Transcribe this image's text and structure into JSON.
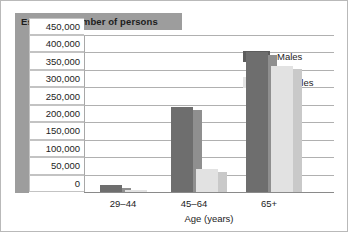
{
  "chart_data": {
    "type": "bar",
    "title": "Estimated number of persons",
    "xlabel": "Age (years)",
    "ylabel": "",
    "categories": [
      "29–44",
      "45–64",
      "65+"
    ],
    "series": [
      {
        "name": "Males",
        "values": [
          20000,
          245000,
          400000
        ],
        "color": "#6e6e6e"
      },
      {
        "name": "Females",
        "values": [
          5000,
          67000,
          360000
        ],
        "color": "#e2e2e2"
      }
    ],
    "ylim": [
      0,
      450000
    ],
    "ytick_labels": [
      "450,000",
      "400,000",
      "350,000",
      "300,000",
      "250,000",
      "200,000",
      "150,000",
      "100,000",
      "50,000",
      "0"
    ],
    "ytick_values": [
      450000,
      400000,
      350000,
      300000,
      250000,
      200000,
      150000,
      100000,
      50000,
      0
    ],
    "grid": true,
    "legend_position": "right"
  },
  "legend": {
    "entries": [
      {
        "label": "Males"
      },
      {
        "label": "Females"
      }
    ]
  }
}
